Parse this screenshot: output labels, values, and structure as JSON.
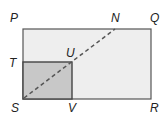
{
  "diagram": {
    "type": "geometry-figure",
    "outer_rectangle": {
      "name": "PQRS",
      "fill": "#eeeeee",
      "stroke": "#555555"
    },
    "inner_rectangle": {
      "name": "TUVS",
      "fill": "#c8c8c8",
      "stroke": "#444444"
    },
    "dashed_segment": {
      "from": "S",
      "to": "N",
      "through": "U",
      "color": "#555555"
    },
    "labels": {
      "P": "P",
      "N": "N",
      "Q": "Q",
      "T": "T",
      "U": "U",
      "S": "S",
      "V": "V",
      "R": "R"
    }
  }
}
